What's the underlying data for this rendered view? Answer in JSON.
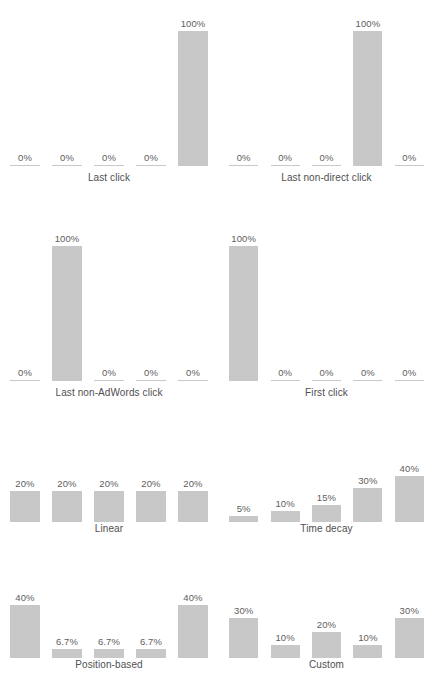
{
  "figure": {
    "title": "",
    "background_color": "#ffffff",
    "bar_color": "#c8c8c8",
    "text_color": "#5a5a5a",
    "value_suffix": "%"
  },
  "chart_data": [
    {
      "type": "bar",
      "title": "Last click",
      "categories": [
        "1",
        "2",
        "3",
        "4",
        "5"
      ],
      "values": [
        0,
        0,
        0,
        0,
        100
      ],
      "labels": [
        "0%",
        "0%",
        "0%",
        "0%",
        "100%"
      ],
      "xlabel": "",
      "ylabel": "",
      "ylim": [
        0,
        100
      ],
      "grid": false,
      "legend": "none"
    },
    {
      "type": "bar",
      "title": "Last non-direct click",
      "categories": [
        "1",
        "2",
        "3",
        "4",
        "5"
      ],
      "values": [
        0,
        0,
        0,
        100,
        0
      ],
      "labels": [
        "0%",
        "0%",
        "0%",
        "100%",
        "0%"
      ],
      "xlabel": "",
      "ylabel": "",
      "ylim": [
        0,
        100
      ],
      "grid": false,
      "legend": "none"
    },
    {
      "type": "bar",
      "title": "Last non-AdWords click",
      "categories": [
        "1",
        "2",
        "3",
        "4",
        "5"
      ],
      "values": [
        0,
        100,
        0,
        0,
        0
      ],
      "labels": [
        "0%",
        "100%",
        "0%",
        "0%",
        "0%"
      ],
      "xlabel": "",
      "ylabel": "",
      "ylim": [
        0,
        100
      ],
      "grid": false,
      "legend": "none"
    },
    {
      "type": "bar",
      "title": "First click",
      "categories": [
        "1",
        "2",
        "3",
        "4",
        "5"
      ],
      "values": [
        100,
        0,
        0,
        0,
        0
      ],
      "labels": [
        "100%",
        "0%",
        "0%",
        "0%",
        "0%"
      ],
      "xlabel": "",
      "ylabel": "",
      "ylim": [
        0,
        100
      ],
      "grid": false,
      "legend": "none"
    },
    {
      "type": "bar",
      "title": "Linear",
      "categories": [
        "1",
        "2",
        "3",
        "4",
        "5"
      ],
      "values": [
        20,
        20,
        20,
        20,
        20
      ],
      "labels": [
        "20%",
        "20%",
        "20%",
        "20%",
        "20%"
      ],
      "xlabel": "",
      "ylabel": "",
      "ylim": [
        0,
        100
      ],
      "grid": false,
      "legend": "none"
    },
    {
      "type": "bar",
      "title": "Time decay",
      "categories": [
        "1",
        "2",
        "3",
        "4",
        "5"
      ],
      "values": [
        5,
        10,
        15,
        30,
        40
      ],
      "labels": [
        "5%",
        "10%",
        "15%",
        "30%",
        "40%"
      ],
      "xlabel": "",
      "ylabel": "",
      "ylim": [
        0,
        100
      ],
      "grid": false,
      "legend": "none"
    },
    {
      "type": "bar",
      "title": "Position-based",
      "categories": [
        "1",
        "2",
        "3",
        "4",
        "5"
      ],
      "values": [
        40,
        6.7,
        6.7,
        6.7,
        40
      ],
      "labels": [
        "40%",
        "6.7%",
        "6.7%",
        "6.7%",
        "40%"
      ],
      "xlabel": "",
      "ylabel": "",
      "ylim": [
        0,
        100
      ],
      "grid": false,
      "legend": "none"
    },
    {
      "type": "bar",
      "title": "Custom",
      "categories": [
        "1",
        "2",
        "3",
        "4",
        "5"
      ],
      "values": [
        30,
        10,
        20,
        10,
        30
      ],
      "labels": [
        "30%",
        "10%",
        "20%",
        "10%",
        "30%"
      ],
      "xlabel": "",
      "ylabel": "",
      "ylim": [
        0,
        100
      ],
      "grid": false,
      "legend": "none"
    }
  ],
  "layout": {
    "panels": [
      {
        "chart": 0,
        "left": 4,
        "top": 14,
        "width": 210,
        "height": 152,
        "bar_px_per_unit": 1.35,
        "label_top": 172
      },
      {
        "chart": 1,
        "left": 223,
        "top": 14,
        "width": 207,
        "height": 152,
        "bar_px_per_unit": 1.35,
        "label_top": 172
      },
      {
        "chart": 2,
        "left": 4,
        "top": 229,
        "width": 210,
        "height": 152,
        "bar_px_per_unit": 1.35,
        "label_top": 387
      },
      {
        "chart": 3,
        "left": 223,
        "top": 229,
        "width": 207,
        "height": 152,
        "bar_px_per_unit": 1.35,
        "label_top": 387
      },
      {
        "chart": 4,
        "left": 4,
        "top": 470,
        "width": 210,
        "height": 52,
        "bar_px_per_unit": 1.55,
        "label_top": 523
      },
      {
        "chart": 5,
        "left": 223,
        "top": 458,
        "width": 207,
        "height": 64,
        "bar_px_per_unit": 1.15,
        "label_top": 523
      },
      {
        "chart": 6,
        "left": 4,
        "top": 592,
        "width": 210,
        "height": 66,
        "bar_px_per_unit": 1.32,
        "label_top": 659
      },
      {
        "chart": 7,
        "left": 223,
        "top": 592,
        "width": 207,
        "height": 66,
        "bar_px_per_unit": 1.32,
        "label_top": 659
      }
    ]
  }
}
